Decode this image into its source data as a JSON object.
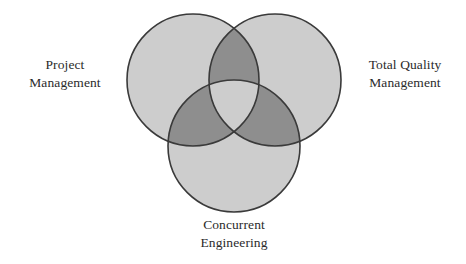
{
  "diagram": {
    "type": "venn",
    "set_count": 3,
    "background_color": "#ffffff",
    "circle_fill_color": "#cdcdcd",
    "overlap_fill_color": "#8e8e8e",
    "circle_stroke_color": "#3a3a3a",
    "label_text_color": "#2b2b2b",
    "circles": [
      {
        "id": "project-management",
        "cx": 193,
        "cy": 80,
        "r": 66
      },
      {
        "id": "total-quality-management",
        "cx": 275,
        "cy": 80,
        "r": 66
      },
      {
        "id": "concurrent-engineering",
        "cx": 234,
        "cy": 146,
        "r": 66
      }
    ],
    "labels": {
      "project_management": {
        "line1": "Project",
        "line2": "Management"
      },
      "total_quality_management": {
        "line1": "Total Quality",
        "line2": "Management"
      },
      "concurrent_engineering": {
        "line1": "Concurrent",
        "line2": "Engineering"
      }
    }
  }
}
